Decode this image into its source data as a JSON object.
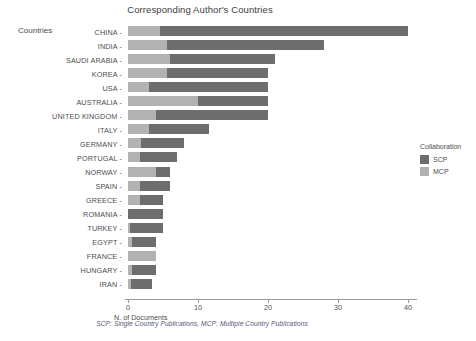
{
  "chart_data": {
    "type": "bar",
    "orientation": "horizontal",
    "stacked": true,
    "title": "Corresponding Author's Countries",
    "xlabel": "N. of Documents",
    "ylabel": "Countries",
    "xlim": [
      0,
      41
    ],
    "xticks": [
      0,
      10,
      20,
      30,
      40
    ],
    "xtick_labels": [
      "0",
      "10",
      "20",
      "30",
      "40"
    ],
    "grid": false,
    "legend": {
      "title": "Collaboration",
      "position": "right",
      "entries": [
        {
          "name": "SCP",
          "color": "#6d6d6d"
        },
        {
          "name": "MCP",
          "color": "#b2b2b2"
        }
      ]
    },
    "caption": "SCP: Single Country Publications, MCP: Multiple Country Publications",
    "categories": [
      "CHINA",
      "INDIA",
      "SAUDI ARABIA",
      "KOREA",
      "USA",
      "AUSTRALIA",
      "UNITED KINGDOM",
      "ITALY",
      "GERMANY",
      "PORTUGAL",
      "NORWAY",
      "SPAIN",
      "GREECE",
      "ROMANIA",
      "TURKEY",
      "EGYPT",
      "FRANCE",
      "HUNGARY",
      "IRAN"
    ],
    "series": [
      {
        "name": "MCP",
        "color": "#b2b2b2",
        "values": [
          4.6,
          5.5,
          6.0,
          5.5,
          3.0,
          10.0,
          4.0,
          3.0,
          1.8,
          1.7,
          4.0,
          1.7,
          1.7,
          0.0,
          0.3,
          0.6,
          4.0,
          0.5,
          0.4
        ]
      },
      {
        "name": "SCP",
        "color": "#6d6d6d",
        "values": [
          35.4,
          22.5,
          15.0,
          14.5,
          17.0,
          10.0,
          16.0,
          8.5,
          6.2,
          5.3,
          2.0,
          4.3,
          3.3,
          5.0,
          4.7,
          3.4,
          0.0,
          3.5,
          3.1
        ]
      }
    ],
    "totals": [
      40,
      28,
      21,
      20,
      20,
      20,
      20,
      11.5,
      8,
      7,
      6,
      6,
      5,
      5,
      5,
      4,
      4,
      4,
      3.5
    ]
  }
}
